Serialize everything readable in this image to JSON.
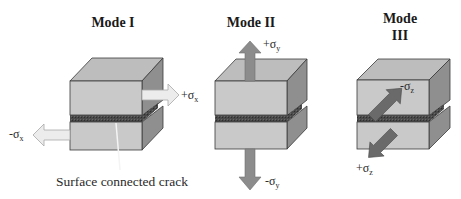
{
  "figure": {
    "panels": [
      {
        "id": "mode-1",
        "title": "Mode I",
        "arrows": [
          {
            "sign": "+",
            "symbol": "σ",
            "subscript": "x",
            "direction": "right",
            "style": "hollow-light"
          },
          {
            "sign": "-",
            "symbol": "σ",
            "subscript": "x",
            "direction": "left",
            "style": "hollow-light"
          }
        ],
        "caption": "Surface connected crack"
      },
      {
        "id": "mode-2",
        "title": "Mode II",
        "arrows": [
          {
            "sign": "+",
            "symbol": "σ",
            "subscript": "y",
            "direction": "up",
            "style": "solid-gray"
          },
          {
            "sign": "-",
            "symbol": "σ",
            "subscript": "y",
            "direction": "down",
            "style": "solid-gray"
          }
        ]
      },
      {
        "id": "mode-3",
        "title_line1": "Mode",
        "title_line2": "III",
        "arrows": [
          {
            "sign": "-",
            "symbol": "σ",
            "subscript": "z",
            "direction": "up-right (into page)",
            "style": "solid-dark"
          },
          {
            "sign": "+",
            "symbol": "σ",
            "subscript": "z",
            "direction": "down-left (out of page)",
            "style": "solid-dark"
          }
        ]
      }
    ],
    "colors": {
      "front_face": "#c9c9c9",
      "top_face": "#bdbdbd",
      "side_face": "#8f8f8f",
      "crack": "#4a4a4a",
      "edge": "#3a3a3a",
      "arrow_light": "#ececec",
      "arrow_gray": "#8c8c8c",
      "arrow_dark": "#6a6a6a"
    }
  }
}
